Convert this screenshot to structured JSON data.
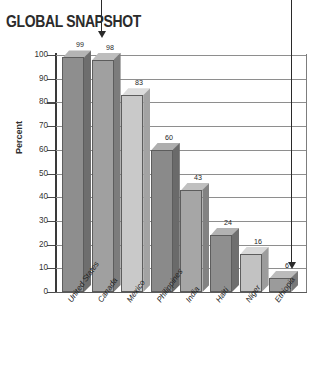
{
  "title": "GLOBAL SNAPSHOT",
  "chart_data": {
    "type": "bar",
    "title": "GLOBAL SNAPSHOT",
    "xlabel": "",
    "ylabel": "Percent",
    "ylim": [
      0,
      100
    ],
    "yticks": [
      0,
      10,
      20,
      30,
      40,
      50,
      60,
      70,
      80,
      90,
      100
    ],
    "grid": true,
    "legend": "none",
    "categories": [
      "United States",
      "Canada",
      "Mexico",
      "Philippines",
      "India",
      "Haiti",
      "Niger",
      "Ethiopia"
    ],
    "values": [
      99,
      98,
      83,
      60,
      43,
      24,
      16,
      6
    ],
    "bar_colors": [
      "#8e8e8e",
      "#a0a0a0",
      "#c9c9c9",
      "#8a8a8a",
      "#a6a6a6",
      "#8f8f8f",
      "#c2c2c2",
      "#9b9b9b"
    ],
    "bar_side_colors": [
      "#6e6e6e",
      "#7c7c7c",
      "#a3a3a3",
      "#6a6a6a",
      "#828282",
      "#6f6f6f",
      "#9c9c9c",
      "#787878"
    ],
    "bar_top_colors": [
      "#b4b4b4",
      "#bdbdbd",
      "#dcdcdc",
      "#aeaeae",
      "#c0c0c0",
      "#b2b2b2",
      "#d8d8d8",
      "#bbbbbb"
    ],
    "annotations": [
      {
        "name": "pointer-to-first-bar",
        "target": "United States"
      },
      {
        "name": "pointer-to-last-bar",
        "target": "Ethiopia"
      }
    ]
  }
}
